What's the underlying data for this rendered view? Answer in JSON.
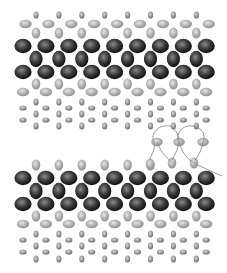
{
  "diagram": {
    "title": "",
    "width": 227,
    "height": 273,
    "colors": {
      "background": "#ffffff",
      "dark_bead_light": "#8a8a8a",
      "dark_bead_mid": "#3a3a3a",
      "dark_bead_edge": "#0e0e0e",
      "light_bead_light": "#e6e6e6",
      "light_bead_mid": "#b4b4b4",
      "light_bead_edge": "#8e8e8e",
      "small_bead_light": "#d8d8d8",
      "small_bead_mid": "#9c9c9c",
      "small_bead_edge": "#6e6e6e",
      "thread": "#8c8c8c"
    },
    "x_start_even": 23,
    "x_start_odd": 36,
    "x_step": 22.9,
    "sections": [
      {
        "name": "top-beadwork-band",
        "rows": [
          {
            "kind": "small-vertical",
            "y": 15,
            "offset": "odd",
            "count": 8,
            "rx": 2.6,
            "ry": 3.6
          },
          {
            "kind": "light-horizontal",
            "y": 24,
            "offset": "even-shift",
            "count": 9,
            "rx": 6.2,
            "ry": 4.2
          },
          {
            "kind": "light-vertical",
            "y": 33,
            "offset": "odd",
            "count": 8,
            "rx": 4.3,
            "ry": 5.6
          },
          {
            "kind": "dark-large",
            "y": 46,
            "offset": "even",
            "count": 9,
            "rx": 8.6,
            "ry": 7.2
          },
          {
            "kind": "dark-vertical",
            "y": 59,
            "offset": "odd",
            "count": 8,
            "rx": 6.6,
            "ry": 8.2
          },
          {
            "kind": "dark-large",
            "y": 72,
            "offset": "even",
            "count": 9,
            "rx": 8.6,
            "ry": 7.2
          },
          {
            "kind": "light-vertical",
            "y": 84,
            "offset": "odd",
            "count": 8,
            "rx": 4.3,
            "ry": 5.6
          },
          {
            "kind": "light-horizontal",
            "y": 92,
            "offset": "even",
            "count": 9,
            "rx": 6.2,
            "ry": 4.2
          },
          {
            "kind": "small-vertical",
            "y": 102,
            "offset": "odd",
            "count": 8,
            "rx": 2.6,
            "ry": 3.6
          },
          {
            "kind": "small-horizontal",
            "y": 108,
            "offset": "even",
            "count": 9,
            "rx": 3.6,
            "ry": 2.6
          },
          {
            "kind": "small-vertical",
            "y": 114,
            "offset": "odd",
            "count": 8,
            "rx": 2.6,
            "ry": 3.6
          },
          {
            "kind": "small-horizontal",
            "y": 120,
            "offset": "even",
            "count": 9,
            "rx": 3.6,
            "ry": 2.6
          },
          {
            "kind": "small-vertical",
            "y": 126,
            "offset": "odd",
            "count": 8,
            "rx": 2.6,
            "ry": 3.6
          }
        ]
      },
      {
        "name": "bottom-beadwork-band",
        "rows": [
          {
            "kind": "light-vertical",
            "y": 165,
            "offset": "odd",
            "count": 6,
            "rx": 4.3,
            "ry": 5.6
          },
          {
            "kind": "dark-large",
            "y": 178,
            "offset": "even",
            "count": 9,
            "rx": 8.6,
            "ry": 7.2
          },
          {
            "kind": "dark-vertical",
            "y": 191,
            "offset": "odd",
            "count": 8,
            "rx": 6.6,
            "ry": 8.2
          },
          {
            "kind": "dark-large",
            "y": 204,
            "offset": "even",
            "count": 9,
            "rx": 8.6,
            "ry": 7.2
          },
          {
            "kind": "light-vertical",
            "y": 216,
            "offset": "odd",
            "count": 8,
            "rx": 4.3,
            "ry": 5.6
          },
          {
            "kind": "light-horizontal",
            "y": 224,
            "offset": "even",
            "count": 9,
            "rx": 6.2,
            "ry": 4.2
          },
          {
            "kind": "small-vertical",
            "y": 234,
            "offset": "odd",
            "count": 8,
            "rx": 2.6,
            "ry": 3.6
          },
          {
            "kind": "small-horizontal",
            "y": 240,
            "offset": "even",
            "count": 9,
            "rx": 3.6,
            "ry": 2.6
          },
          {
            "kind": "small-vertical",
            "y": 246,
            "offset": "odd",
            "count": 8,
            "rx": 2.6,
            "ry": 3.6
          },
          {
            "kind": "small-horizontal",
            "y": 252,
            "offset": "even",
            "count": 9,
            "rx": 3.6,
            "ry": 2.6
          },
          {
            "kind": "small-vertical",
            "y": 259,
            "offset": "odd",
            "count": 8,
            "rx": 2.6,
            "ry": 3.6
          }
        ]
      }
    ],
    "loose_beads": [
      {
        "kind": "light-horizontal",
        "x": 157,
        "y": 142,
        "rx": 5.8,
        "ry": 4.2
      },
      {
        "kind": "light-horizontal",
        "x": 179,
        "y": 142,
        "rx": 5.8,
        "ry": 4.2
      },
      {
        "kind": "light-horizontal",
        "x": 203,
        "y": 142,
        "rx": 5.8,
        "ry": 4.2
      },
      {
        "kind": "light-vertical",
        "x": 150,
        "y": 164,
        "rx": 4.3,
        "ry": 5.6
      },
      {
        "kind": "light-vertical",
        "x": 172,
        "y": 163,
        "rx": 4.3,
        "ry": 5.6
      },
      {
        "kind": "light-vertical",
        "x": 194,
        "y": 163,
        "rx": 4.3,
        "ry": 5.6
      }
    ],
    "thread_paths": [
      "M170 126 C 158 124, 150 134, 154 142 C 156 150, 150 156, 150 160",
      "M170 126 C 176 130, 180 136, 179 142 C 178 150, 174 156, 172 160",
      "M193 126 C 182 124, 176 134, 178 142",
      "M193 126 C 202 128, 206 134, 203 142 C 201 152, 198 156, 195 160",
      "M179 142 C 182 152, 186 158, 194 163 C 204 168, 212 172, 222 176",
      "M157 142 C 160 150, 164 156, 172 162"
    ]
  }
}
